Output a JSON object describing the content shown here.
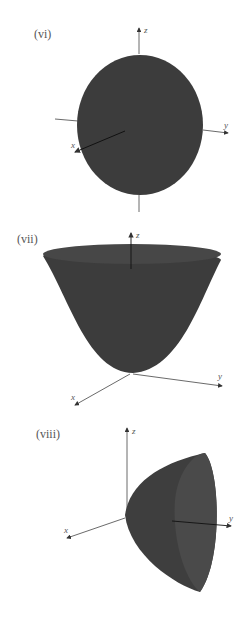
{
  "figures": [
    {
      "label": "(vi)",
      "surface": "ellipsoid",
      "axes": {
        "x": "x",
        "y": "y",
        "z": "z"
      }
    },
    {
      "label": "(vii)",
      "surface": "elliptic paraboloid opening along z",
      "axes": {
        "x": "x",
        "y": "y",
        "z": "z"
      }
    },
    {
      "label": "(viii)",
      "surface": "elliptic paraboloid opening along y",
      "axes": {
        "x": "x",
        "y": "y",
        "z": "z"
      }
    }
  ],
  "colors": {
    "surface": "#3c3c3c",
    "axis": "#444444",
    "background": "#ffffff"
  }
}
